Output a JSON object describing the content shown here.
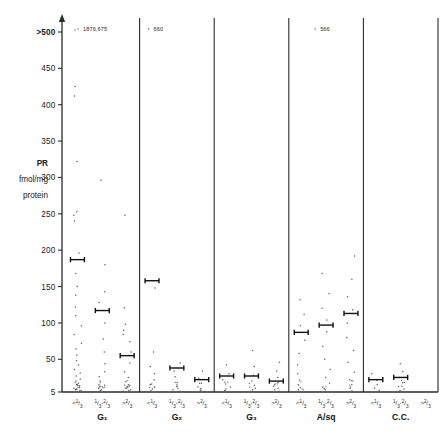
{
  "figure": {
    "y_axis_title_lines": [
      "PR",
      "fmol/mg",
      "protein"
    ],
    "y_ticks": [
      {
        "label": ">500",
        "value": 500
      },
      {
        "label": "450",
        "value": 450
      },
      {
        "label": "400",
        "value": 400
      },
      {
        "label": "350",
        "value": 350
      },
      {
        "label": "300",
        "value": 300
      },
      {
        "label": "250",
        "value": 250
      },
      {
        "label": "200",
        "value": 200
      },
      {
        "label": "150",
        "value": 150
      },
      {
        "label": "100",
        "value": 100
      },
      {
        "label": "50",
        "value": 50
      },
      {
        "label": "5",
        "value": 5
      }
    ],
    "column_labels": [
      "<1/3",
      "1/3-2/3",
      ">2/3"
    ],
    "group_labels": [
      "G₁",
      "G₂",
      "G₃",
      "A/sq",
      "C.C."
    ],
    "offscale_annotations": [
      {
        "group": "G₁",
        "text": "1876,675"
      },
      {
        "group": "G₂",
        "text": "660"
      },
      {
        "group": "A/sq",
        "text": "566"
      }
    ]
  },
  "chart_data": {
    "type": "scatter",
    "title": "",
    "xlabel": "",
    "ylabel": "PR fmol/mg protein",
    "ylim": [
      5,
      500
    ],
    "grid": false,
    "legend": "none",
    "categories": [
      "<1/3",
      "1/3-2/3",
      ">2/3"
    ],
    "groups": [
      {
        "name": "G₁",
        "columns": [
          {
            "label": "<1/3",
            "median": 187,
            "offscale_note": "1876,675",
            "points": [
              425,
              412,
              322,
              253,
              248,
              240,
              196,
              168,
              150,
              138,
              122,
              110,
              96,
              84,
              72,
              64,
              56,
              48,
              42,
              36,
              31,
              27,
              23,
              20,
              17,
              15,
              13,
              11,
              10,
              9,
              8,
              7
            ]
          },
          {
            "label": "1/3-2/3",
            "median": 117,
            "points": [
              296,
              180,
              143,
              128,
              100,
              78,
              60,
              44,
              33,
              26,
              20,
              15,
              12,
              10,
              8,
              7
            ]
          },
          {
            "label": ">2/3",
            "median": 55,
            "points": [
              248,
              121,
              98,
              90,
              84,
              74,
              60,
              45,
              33,
              25,
              19,
              15,
              12,
              10,
              8,
              7,
              6
            ]
          }
        ]
      },
      {
        "name": "G₂",
        "columns": [
          {
            "label": "<1/3",
            "median": 158,
            "offscale_note": "660",
            "points": [
              148,
              60,
              40,
              30,
              22,
              16,
              12,
              9,
              7
            ]
          },
          {
            "label": "1/3-2/3",
            "median": 38,
            "points": [
              45,
              34,
              26,
              18,
              13,
              10,
              8,
              6
            ]
          },
          {
            "label": ">2/3",
            "median": 22,
            "points": [
              34,
              24,
              17,
              12,
              9,
              7,
              6
            ]
          }
        ]
      },
      {
        "name": "G₃",
        "columns": [
          {
            "label": "<1/3",
            "median": 27,
            "points": [
              42,
              30,
              22,
              16,
              12,
              9,
              7,
              6
            ]
          },
          {
            "label": "1/3-2/3",
            "median": 27,
            "points": [
              62,
              40,
              28,
              20,
              14,
              10,
              8,
              6
            ]
          },
          {
            "label": ">2/3",
            "median": 20,
            "points": [
              46,
              34,
              25,
              18,
              13,
              10,
              8,
              6,
              5
            ]
          }
        ]
      },
      {
        "name": "A/sq",
        "columns": [
          {
            "label": "<1/3",
            "median": 87,
            "points": [
              132,
              112,
              96,
              76,
              58,
              42,
              30,
              21,
              15,
              11,
              8
            ]
          },
          {
            "label": "1/3-2/3",
            "median": 97,
            "points": [
              168,
              140,
              120,
              104,
              88,
              68,
              50,
              36,
              25,
              17,
              12,
              9
            ]
          },
          {
            "label": ">2/3",
            "median": 113,
            "offscale_note": "566",
            "points": [
              192,
              160,
              136,
              118,
              100,
              80,
              62,
              46,
              32,
              22,
              15,
              10
            ]
          }
        ]
      },
      {
        "name": "C.C.",
        "columns": [
          {
            "label": "<1/3",
            "median": 22,
            "points": [
              30,
              21,
              15,
              10,
              7
            ]
          },
          {
            "label": "1/3-2/3",
            "median": 25,
            "points": [
              44,
              33,
              25,
              18,
              13,
              9,
              7
            ]
          },
          {
            "label": ">2/3",
            "median": null,
            "points": []
          }
        ]
      }
    ]
  }
}
